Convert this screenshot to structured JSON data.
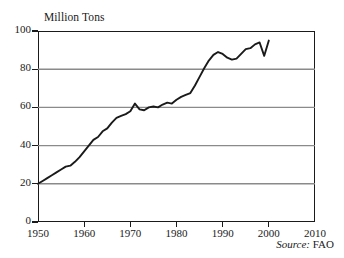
{
  "chart_data": {
    "type": "line",
    "title": "Million Tons",
    "xlabel": "",
    "ylabel": "Million Tons",
    "xlim": [
      1950,
      2010
    ],
    "ylim": [
      0,
      100
    ],
    "xticks": [
      1950,
      1960,
      1970,
      1980,
      1990,
      2000,
      2010
    ],
    "yticks": [
      0,
      20,
      40,
      60,
      80,
      100
    ],
    "grid": "horizontal",
    "gridlines_at": [
      20,
      40,
      60,
      80
    ],
    "legend": "none",
    "annotation": {
      "label": "Source:",
      "value": "FAO",
      "position": "bottom-right-inside"
    },
    "series": [
      {
        "name": "World Production",
        "color": "#1a1a1a",
        "x": [
          1950,
          1951,
          1952,
          1953,
          1954,
          1955,
          1956,
          1957,
          1958,
          1959,
          1960,
          1961,
          1962,
          1963,
          1964,
          1965,
          1966,
          1967,
          1968,
          1969,
          1970,
          1971,
          1972,
          1973,
          1974,
          1975,
          1976,
          1977,
          1978,
          1979,
          1980,
          1981,
          1982,
          1983,
          1984,
          1985,
          1986,
          1987,
          1988,
          1989,
          1990,
          1991,
          1992,
          1993,
          1994,
          1995,
          1996,
          1997,
          1998,
          1999,
          2000
        ],
        "values": [
          20,
          21.5,
          23,
          24.5,
          26,
          27.5,
          29,
          29.5,
          31.5,
          34,
          37,
          40,
          43,
          44.5,
          47.5,
          49,
          52,
          54.5,
          55.5,
          56.5,
          58,
          62,
          59,
          58.5,
          60,
          60.5,
          60,
          61.5,
          62.5,
          62,
          64,
          65.5,
          66.5,
          67.5,
          71.5,
          76,
          80.5,
          84.5,
          87.5,
          89,
          88,
          86,
          85,
          85.5,
          88,
          90.5,
          91,
          93,
          94,
          87,
          95
        ]
      }
    ]
  }
}
